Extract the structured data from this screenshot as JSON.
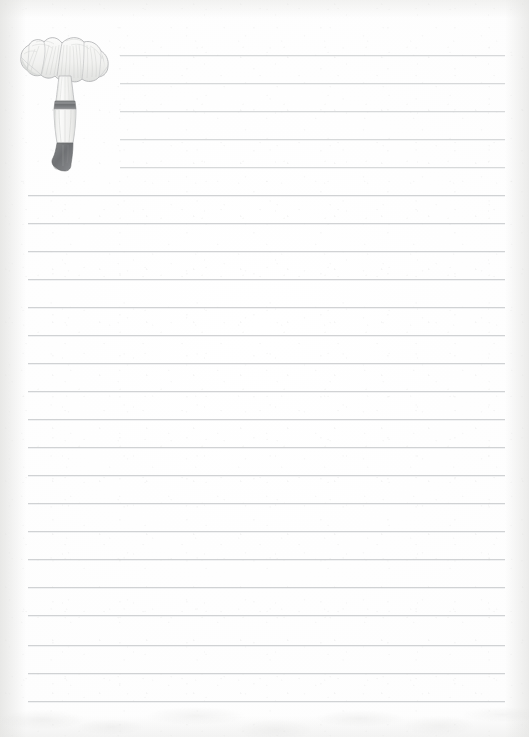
{
  "page": {
    "kind": "lined-stationery-sheet",
    "width_px": 529,
    "height_px": 737,
    "paper_color": "#fdfdfc",
    "edge_tint_color": "#f2f2f1"
  },
  "rules": {
    "label": "Ruled writing lines",
    "color": "#c9cbcd",
    "count": 24,
    "line_height_px": 1,
    "spacing_px": 28,
    "first_line_y": 55,
    "last_line_y": 700,
    "margin_left_px": 28,
    "margin_right_px": 505,
    "indented_left_px": 120,
    "indented_line_count": 5,
    "lines": [
      {
        "index": 1,
        "y": 55,
        "x1": 120,
        "x2": 505,
        "indented": true
      },
      {
        "index": 2,
        "y": 83,
        "x1": 120,
        "x2": 505,
        "indented": true
      },
      {
        "index": 3,
        "y": 111,
        "x1": 120,
        "x2": 505,
        "indented": true
      },
      {
        "index": 4,
        "y": 139,
        "x1": 120,
        "x2": 505,
        "indented": true
      },
      {
        "index": 5,
        "y": 167,
        "x1": 120,
        "x2": 505,
        "indented": true
      },
      {
        "index": 6,
        "y": 195,
        "x1": 28,
        "x2": 505,
        "indented": false
      },
      {
        "index": 7,
        "y": 223,
        "x1": 28,
        "x2": 505,
        "indented": false
      },
      {
        "index": 8,
        "y": 251,
        "x1": 28,
        "x2": 505,
        "indented": false
      },
      {
        "index": 9,
        "y": 279,
        "x1": 28,
        "x2": 505,
        "indented": false
      },
      {
        "index": 10,
        "y": 307,
        "x1": 28,
        "x2": 505,
        "indented": false
      },
      {
        "index": 11,
        "y": 335,
        "x1": 28,
        "x2": 505,
        "indented": false
      },
      {
        "index": 12,
        "y": 363,
        "x1": 28,
        "x2": 505,
        "indented": false
      },
      {
        "index": 13,
        "y": 391,
        "x1": 28,
        "x2": 505,
        "indented": false
      },
      {
        "index": 14,
        "y": 419,
        "x1": 28,
        "x2": 505,
        "indented": false
      },
      {
        "index": 15,
        "y": 447,
        "x1": 28,
        "x2": 505,
        "indented": false
      },
      {
        "index": 16,
        "y": 475,
        "x1": 28,
        "x2": 505,
        "indented": false
      },
      {
        "index": 17,
        "y": 503,
        "x1": 28,
        "x2": 505,
        "indented": false
      },
      {
        "index": 18,
        "y": 531,
        "x1": 28,
        "x2": 505,
        "indented": false
      },
      {
        "index": 19,
        "y": 559,
        "x1": 28,
        "x2": 505,
        "indented": false
      },
      {
        "index": 20,
        "y": 587,
        "x1": 28,
        "x2": 505,
        "indented": false
      },
      {
        "index": 21,
        "y": 615,
        "x1": 28,
        "x2": 505,
        "indented": false
      },
      {
        "index": 22,
        "y": 645,
        "x1": 28,
        "x2": 505,
        "indented": false
      },
      {
        "index": 23,
        "y": 673,
        "x1": 28,
        "x2": 505,
        "indented": false
      },
      {
        "index": 24,
        "y": 701,
        "x1": 28,
        "x2": 505,
        "indented": false
      }
    ]
  },
  "illustration": {
    "name": "mushroom-illustration",
    "subject": "chanterelle mushroom",
    "style": "faded pencil / lithograph botanical drawing",
    "position": {
      "left": 18,
      "top": 30,
      "width": 94,
      "height": 145
    },
    "colors": {
      "outline": "#9a9c9e",
      "cap_fill": "#f4f4f2",
      "cap_shade": "#d8d9d7",
      "gill_hatch": "#b6b8b6",
      "stem_fill": "#f2f2f0",
      "stem_band": "#6e7072",
      "stem_base": "#6b6d6f"
    },
    "parts": [
      {
        "name": "cap",
        "label": "wavy funnel-shaped cap"
      },
      {
        "name": "gills",
        "label": "decurrent ridged gills"
      },
      {
        "name": "stem",
        "label": "tapering stipe"
      },
      {
        "name": "stem-band",
        "label": "dark annulus band on stem"
      },
      {
        "name": "stem-base",
        "label": "dark boot-shaped base"
      }
    ]
  },
  "content": {
    "text": "",
    "note": "no written text present on the sheet"
  }
}
